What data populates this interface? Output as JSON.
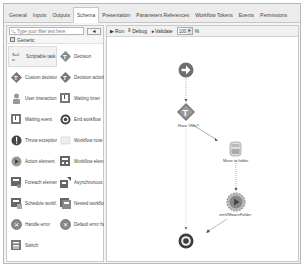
{
  "tabs": [
    {
      "label": "General",
      "active": false
    },
    {
      "label": "Inputs",
      "active": false
    },
    {
      "label": "Outputs",
      "active": false
    },
    {
      "label": "Schema",
      "active": true
    },
    {
      "label": "Presentation",
      "active": false
    },
    {
      "label": "Parameters References",
      "active": false
    },
    {
      "label": "Workflow Tokens",
      "active": false
    },
    {
      "label": "Events",
      "active": false
    },
    {
      "label": "Permissions",
      "active": false
    }
  ],
  "palette": {
    "search_placeholder": "Type your filter text here",
    "search_button": "◄",
    "group_label": "Generic",
    "items": [
      {
        "label": "Scriptable task",
        "icon": "scriptable-task-icon",
        "selected": true
      },
      {
        "label": "Decision",
        "icon": "decision-icon"
      },
      {
        "label": "Custom decision",
        "icon": "custom-decision-icon"
      },
      {
        "label": "Decision activity",
        "icon": "decision-activity-icon"
      },
      {
        "label": "User interaction",
        "icon": "user-interaction-icon"
      },
      {
        "label": "Waiting timer",
        "icon": "waiting-timer-icon"
      },
      {
        "label": "Waiting event",
        "icon": "waiting-event-icon"
      },
      {
        "label": "End workflow",
        "icon": "end-workflow-icon"
      },
      {
        "label": "Throw exception",
        "icon": "throw-exception-icon"
      },
      {
        "label": "Workflow note",
        "icon": "workflow-note-icon"
      },
      {
        "label": "Action element",
        "icon": "action-element-icon"
      },
      {
        "label": "Workflow elem...",
        "icon": "workflow-element-icon"
      },
      {
        "label": "Foreach element",
        "icon": "foreach-element-icon"
      },
      {
        "label": "Asynchronous ...",
        "icon": "asynchronous-workflow-icon"
      },
      {
        "label": "Schedule workf...",
        "icon": "schedule-workflow-icon"
      },
      {
        "label": "Nested workflow",
        "icon": "nested-workflow-icon"
      },
      {
        "label": "Handle error",
        "icon": "handle-error-icon"
      },
      {
        "label": "Default error ha...",
        "icon": "default-error-handler-icon"
      },
      {
        "label": "Switch",
        "icon": "switch-icon"
      }
    ]
  },
  "toolbar": {
    "run": "Run",
    "debug": "Debug",
    "validate": "Validate",
    "zoom": "100",
    "zoom_unit": "%"
  },
  "canvas": {
    "nodes": [
      {
        "id": "start",
        "type": "start",
        "label": ""
      },
      {
        "id": "decision",
        "type": "decision",
        "label": "Have VMs?"
      },
      {
        "id": "task",
        "type": "scriptable-task",
        "label": "Move to folder"
      },
      {
        "id": "action",
        "type": "action",
        "label": "vimVMwareFolder"
      },
      {
        "id": "end",
        "type": "end",
        "label": ""
      }
    ]
  },
  "colors": {
    "node_gray": "#6e6e6e",
    "frame_border": "#b8b8b8",
    "canvas_bg": "#ffffff"
  }
}
